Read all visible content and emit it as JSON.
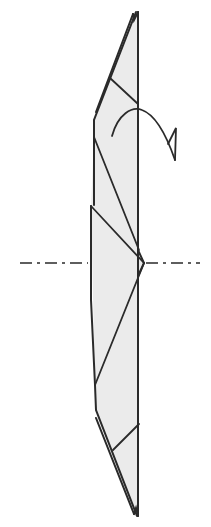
{
  "diagram": {
    "type": "origami-fold-diagram",
    "colors": {
      "paper_fill": "#ebebeb",
      "line": "#2a2a2a",
      "background": "#ffffff"
    },
    "elements": {
      "model": "folded paper model (narrow vertical shape, pointed at top and bottom)",
      "axis": "dash-dot horizontal center line",
      "arrow": "turn-over arrow (curved arrow with half arrowhead)"
    }
  }
}
